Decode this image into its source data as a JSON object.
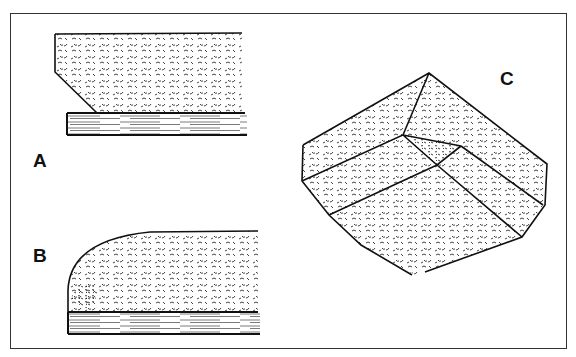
{
  "figure": {
    "panels": [
      {
        "id": "A",
        "label": "A",
        "description": "Straight foam block with chamfered front edge resting on wooden board"
      },
      {
        "id": "B",
        "label": "B",
        "description": "Foam block with rounded front edge resting on wooden board"
      },
      {
        "id": "C",
        "label": "C",
        "description": "Isometric view of foam corner with mitered edges"
      }
    ],
    "colors": {
      "ink": "#111111",
      "background": "#ffffff",
      "frame": "#333333"
    }
  }
}
